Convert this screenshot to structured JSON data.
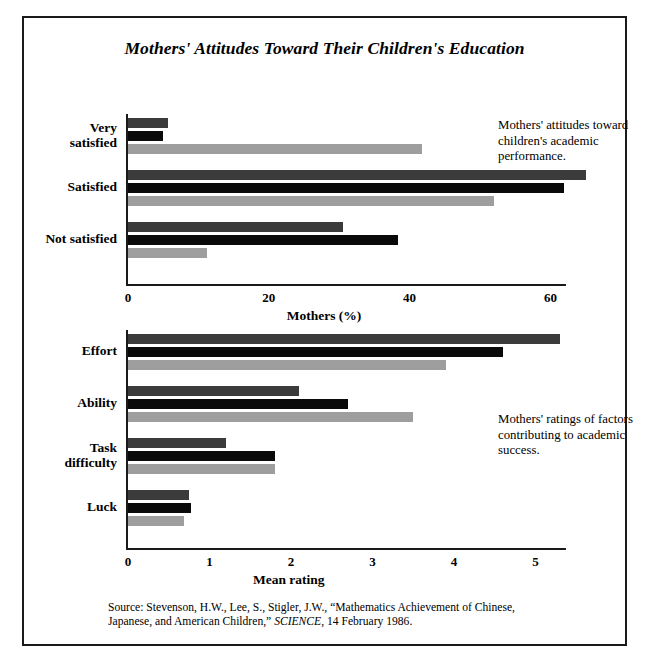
{
  "figure": {
    "title": "Mothers' Attitudes Toward Their Children's Education",
    "source": "Source: Stevenson, H.W., Lee, S., Stigler, J.W., “Mathematics Achievement of Chinese, Japanese, and American Children,” SCIENCE, 14 February 1986.",
    "source_plain": "Source: Stevenson, H.W., Lee, S., Stigler, J.W., “Mathematics Achievement of Chinese, Japanese, and American Children,” ",
    "source_italic": "SCIENCE",
    "source_tail": ", 14 February 1986."
  },
  "annotations": {
    "top": "Mothers' attitudes toward children's academic performance.",
    "bottom": "Mothers' ratings of factors contributing to academic success."
  },
  "colors": {
    "series_dark_gray": "#3b3b3b",
    "series_black": "#0a0a0a",
    "series_light_gray": "#9e9e9e",
    "frame": "#1a1a1a",
    "background": "#ffffff"
  },
  "chart_data": [
    {
      "type": "bar",
      "orientation": "horizontal",
      "title": "Mothers' attitudes toward children's academic performance.",
      "categories": [
        "Very satisfied",
        "Satisfied",
        "Not satisfied"
      ],
      "series": [
        {
          "name": "series-1",
          "color": "#3b3b3b",
          "values": [
            5.7,
            65.0,
            30.6
          ]
        },
        {
          "name": "series-2",
          "color": "#0a0a0a",
          "values": [
            5.0,
            62.0,
            38.4
          ]
        },
        {
          "name": "series-3",
          "color": "#9e9e9e",
          "values": [
            41.7,
            52.0,
            11.2
          ]
        }
      ],
      "xlabel": "Mothers (%)",
      "ylabel": "",
      "xticks": [
        0,
        20,
        40,
        60
      ],
      "xtick_labels": [
        "0",
        "20",
        "40",
        "60"
      ],
      "xlim": [
        0,
        62.5
      ],
      "grid": false,
      "legend": "none"
    },
    {
      "type": "bar",
      "orientation": "horizontal",
      "title": "Mothers' ratings of factors contributing to academic success.",
      "categories": [
        "Effort",
        "Ability",
        "Task difficulty",
        "Luck"
      ],
      "series": [
        {
          "name": "series-1",
          "color": "#3b3b3b",
          "values": [
            5.3,
            2.1,
            1.2,
            0.75
          ]
        },
        {
          "name": "series-2",
          "color": "#0a0a0a",
          "values": [
            4.6,
            2.7,
            1.8,
            0.77
          ]
        },
        {
          "name": "series-3",
          "color": "#9e9e9e",
          "values": [
            3.9,
            3.5,
            1.8,
            0.69
          ]
        }
      ],
      "xlabel": "Mean rating",
      "ylabel": "",
      "xticks": [
        0,
        1,
        2,
        3,
        4,
        5
      ],
      "xtick_labels": [
        "0",
        "1",
        "2",
        "3",
        "4",
        "5"
      ],
      "xlim": [
        0,
        5.4
      ],
      "grid": false,
      "legend": "none"
    }
  ]
}
